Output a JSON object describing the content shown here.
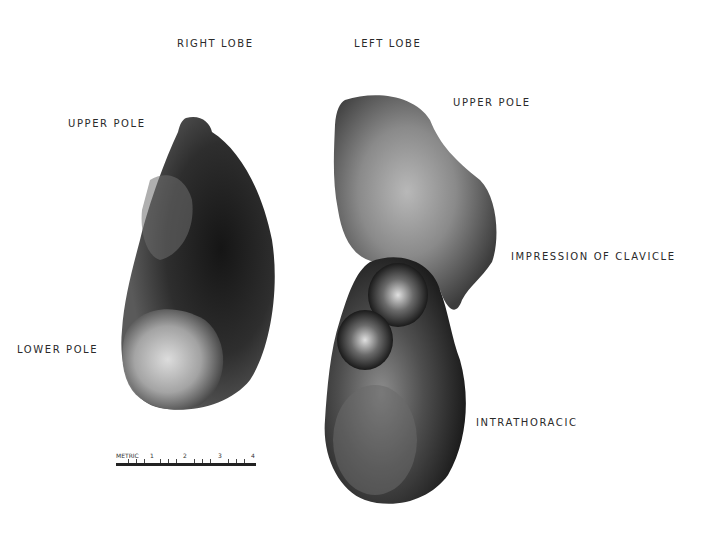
{
  "labels": {
    "right_lobe": "RIGHT LOBE",
    "left_lobe": "LEFT LOBE",
    "upper_pole_right": "UPPER POLE",
    "upper_pole_left": "UPPER POLE",
    "lower_pole": "LOWER POLE",
    "impression_of_clavicle": "IMPRESSION OF CLAVICLE",
    "intrathoracic": "INTRATHORACIC"
  },
  "scale_bar": {
    "unit_label": "METRIC",
    "marks": [
      "1",
      "2",
      "3",
      "4"
    ]
  },
  "colors": {
    "background": "#ffffff",
    "tissue_dark": "#1e1e1e",
    "tissue_mid": "#6a6a6a",
    "tissue_light": "#c8c8c8"
  }
}
